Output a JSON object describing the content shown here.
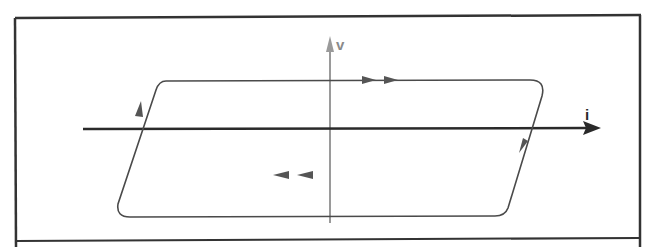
{
  "figure": {
    "type": "hysteresis-loop",
    "axes": {
      "x": {
        "label": "i",
        "color": "#2a2a2a"
      },
      "y": {
        "label": "v",
        "color": "#9a9a9a"
      }
    },
    "loop": {
      "color": "#4a4a4a",
      "direction": "clockwise",
      "top_edge_arrows": 2,
      "bottom_edge_arrows": 2,
      "side_arrows": 2
    },
    "frame_color": "#333333"
  }
}
